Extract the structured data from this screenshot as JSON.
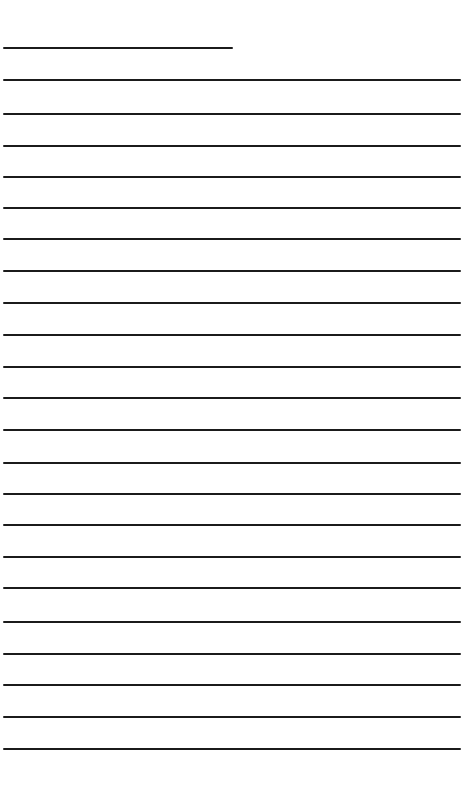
{
  "page": {
    "kind": "lined-writing-sheet",
    "width_px": 473,
    "height_px": 802,
    "background_color": "#ffffff",
    "line_color": "#1b1b1b",
    "line_thickness_px": 2,
    "line_count": 23,
    "line_spacing_px": 31.4,
    "margin_left_px": 3,
    "full_line_right_px": 461,
    "first_line_right_px": 233,
    "visible_text": ""
  },
  "lines": [
    {
      "index": 1,
      "y": 47,
      "x1": 3,
      "x2": 233,
      "thickness": 2,
      "full_width": false,
      "label": "rule-1-short"
    },
    {
      "index": 2,
      "y": 79,
      "x1": 3,
      "x2": 461,
      "thickness": 2,
      "full_width": true,
      "label": "rule-2"
    },
    {
      "index": 3,
      "y": 113,
      "x1": 3,
      "x2": 461,
      "thickness": 2,
      "full_width": true,
      "label": "rule-3"
    },
    {
      "index": 4,
      "y": 145,
      "x1": 3,
      "x2": 461,
      "thickness": 2,
      "full_width": true,
      "label": "rule-4"
    },
    {
      "index": 5,
      "y": 176,
      "x1": 3,
      "x2": 461,
      "thickness": 2,
      "full_width": true,
      "label": "rule-5"
    },
    {
      "index": 6,
      "y": 207,
      "x1": 3,
      "x2": 461,
      "thickness": 2,
      "full_width": true,
      "label": "rule-6"
    },
    {
      "index": 7,
      "y": 238,
      "x1": 3,
      "x2": 461,
      "thickness": 2,
      "full_width": true,
      "label": "rule-7"
    },
    {
      "index": 8,
      "y": 270,
      "x1": 3,
      "x2": 461,
      "thickness": 2,
      "full_width": true,
      "label": "rule-8"
    },
    {
      "index": 9,
      "y": 302,
      "x1": 3,
      "x2": 461,
      "thickness": 2,
      "full_width": true,
      "label": "rule-9"
    },
    {
      "index": 10,
      "y": 334,
      "x1": 3,
      "x2": 461,
      "thickness": 2,
      "full_width": true,
      "label": "rule-10"
    },
    {
      "index": 11,
      "y": 366,
      "x1": 3,
      "x2": 461,
      "thickness": 2,
      "full_width": true,
      "label": "rule-11"
    },
    {
      "index": 12,
      "y": 397,
      "x1": 3,
      "x2": 461,
      "thickness": 2,
      "full_width": true,
      "label": "rule-12"
    },
    {
      "index": 13,
      "y": 429,
      "x1": 3,
      "x2": 461,
      "thickness": 2,
      "full_width": true,
      "label": "rule-13"
    },
    {
      "index": 14,
      "y": 462,
      "x1": 3,
      "x2": 461,
      "thickness": 2,
      "full_width": true,
      "label": "rule-14"
    },
    {
      "index": 15,
      "y": 493,
      "x1": 3,
      "x2": 461,
      "thickness": 2,
      "full_width": true,
      "label": "rule-15"
    },
    {
      "index": 16,
      "y": 524,
      "x1": 3,
      "x2": 461,
      "thickness": 2,
      "full_width": true,
      "label": "rule-16"
    },
    {
      "index": 17,
      "y": 556,
      "x1": 3,
      "x2": 461,
      "thickness": 2,
      "full_width": true,
      "label": "rule-17"
    },
    {
      "index": 18,
      "y": 587,
      "x1": 3,
      "x2": 461,
      "thickness": 2,
      "full_width": true,
      "label": "rule-18"
    },
    {
      "index": 19,
      "y": 621,
      "x1": 3,
      "x2": 461,
      "thickness": 2,
      "full_width": true,
      "label": "rule-19"
    },
    {
      "index": 20,
      "y": 653,
      "x1": 3,
      "x2": 461,
      "thickness": 2,
      "full_width": true,
      "label": "rule-20"
    },
    {
      "index": 21,
      "y": 684,
      "x1": 3,
      "x2": 461,
      "thickness": 2,
      "full_width": true,
      "label": "rule-21"
    },
    {
      "index": 22,
      "y": 716,
      "x1": 3,
      "x2": 461,
      "thickness": 2,
      "full_width": true,
      "label": "rule-22"
    },
    {
      "index": 23,
      "y": 748,
      "x1": 3,
      "x2": 461,
      "thickness": 2,
      "full_width": true,
      "label": "rule-23"
    }
  ]
}
